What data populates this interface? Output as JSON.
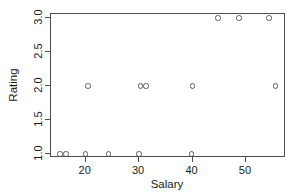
{
  "chart_data": {
    "type": "scatter",
    "title": "",
    "xlabel": "Salary",
    "ylabel": "Rating",
    "xlim": [
      13.5,
      57.5
    ],
    "ylim": [
      0.94,
      3.06
    ],
    "xticks": [
      20,
      30,
      40,
      50
    ],
    "xtick_labels": [
      "20",
      "30",
      "40",
      "50"
    ],
    "yticks": [
      1.0,
      1.5,
      2.0,
      2.5,
      3.0
    ],
    "ytick_labels": [
      "1.0",
      "1.5",
      "2.0",
      "2.5",
      "3.0"
    ],
    "grid": false,
    "legend": null,
    "marker": "open-circle",
    "marker_color": "#595959",
    "x": [
      15.2,
      16.3,
      20.0,
      24.3,
      30.0,
      39.8,
      20.4,
      30.2,
      31.3,
      40.0,
      55.5,
      44.8,
      48.7,
      54.3
    ],
    "y": [
      1.0,
      1.0,
      1.0,
      1.0,
      1.0,
      1.0,
      2.0,
      2.0,
      2.0,
      2.0,
      2.0,
      3.0,
      3.0,
      3.0
    ],
    "points": [
      {
        "x": 15.2,
        "y": 1.0
      },
      {
        "x": 16.3,
        "y": 1.0
      },
      {
        "x": 20.0,
        "y": 1.0
      },
      {
        "x": 24.3,
        "y": 1.0
      },
      {
        "x": 30.0,
        "y": 1.0
      },
      {
        "x": 39.8,
        "y": 1.0
      },
      {
        "x": 20.4,
        "y": 2.0
      },
      {
        "x": 30.2,
        "y": 2.0
      },
      {
        "x": 31.3,
        "y": 2.0
      },
      {
        "x": 40.0,
        "y": 2.0
      },
      {
        "x": 55.5,
        "y": 2.0
      },
      {
        "x": 44.8,
        "y": 3.0
      },
      {
        "x": 48.7,
        "y": 3.0
      },
      {
        "x": 54.3,
        "y": 3.0
      }
    ]
  },
  "figure": {
    "background_color": "#ffffff",
    "axis_color": "#4d4d4d",
    "text_color": "#1a1a1a"
  }
}
